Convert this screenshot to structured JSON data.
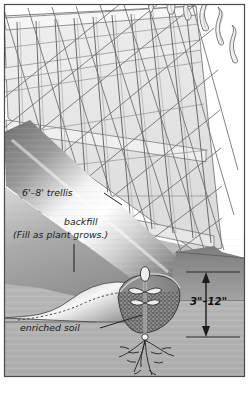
{
  "figure": {
    "frame": {
      "border_color": "#4a4a4a",
      "background_color": "#ffffff"
    },
    "palette": {
      "sky": "#ffffff",
      "ground": "#b4b4b4",
      "ground_dark": "#8e8e8e",
      "mound_light": "#f2f2f2",
      "mound_dark": "#6e6e6e",
      "trellis_fill": "#e8e8e8",
      "trellis_line": "#5c5c5c",
      "trench_soil": "#8a8a8a",
      "ink": "#1b1b1b"
    },
    "labels": [
      {
        "id": "trellis-label",
        "text": "6'–8' trellis",
        "x": 22,
        "y": 196
      },
      {
        "id": "backfill-label",
        "text": "backfill",
        "x": 64,
        "y": 225
      },
      {
        "id": "backfill-note",
        "text": "(Fill as plant grows.)",
        "x": 13,
        "y": 238
      },
      {
        "id": "depth-dimension",
        "text": "3\"–12\"",
        "x": 190,
        "y": 305
      },
      {
        "id": "enriched-soil-label",
        "text": "enriched soil",
        "x": 20,
        "y": 331
      }
    ],
    "elements": {
      "trellis": "lattice trellis panel with vertical posts",
      "mound": "backfilled soil mound with dashed original grade",
      "trench": "stippled planting trench with enriched soil",
      "seedling": "young plant with two leaves and root system",
      "dimension_arrow": "vertical double arrow showing planting depth"
    }
  }
}
